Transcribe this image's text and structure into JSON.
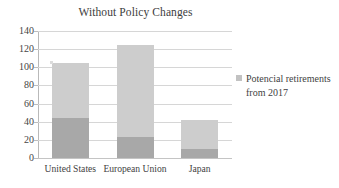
{
  "chart_data": {
    "type": "bar",
    "subtype": "stacked-column",
    "title": "Without Policy Changes",
    "xlabel": "",
    "ylabel": "",
    "categories": [
      "United States",
      "European Union",
      "Japan"
    ],
    "series": [
      {
        "name": "Potencial retirements from 2017",
        "color": "#a8a8a8",
        "values": [
          44,
          23,
          10
        ]
      },
      {
        "name": "Remaining",
        "color": "#cdcdcd",
        "values": [
          61,
          102,
          32
        ]
      }
    ],
    "totals": [
      105,
      125,
      42
    ],
    "ylim": [
      0,
      140
    ],
    "ytick_step": 20,
    "yticks": [
      140,
      120,
      100,
      80,
      60,
      40,
      20,
      0
    ],
    "grid": true,
    "legend_position": "right"
  },
  "legend": {
    "entries": [
      {
        "label": "Potencial retirements from 2017",
        "color": "#c2c2c2"
      }
    ]
  },
  "colors": {
    "lower_segment": "#a8a8a8",
    "upper_segment": "#cdcdcd",
    "gridline": "#d6d6d6",
    "axis": "#b9b9b9",
    "text": "#3f3f3f",
    "background": "#ffffff"
  }
}
